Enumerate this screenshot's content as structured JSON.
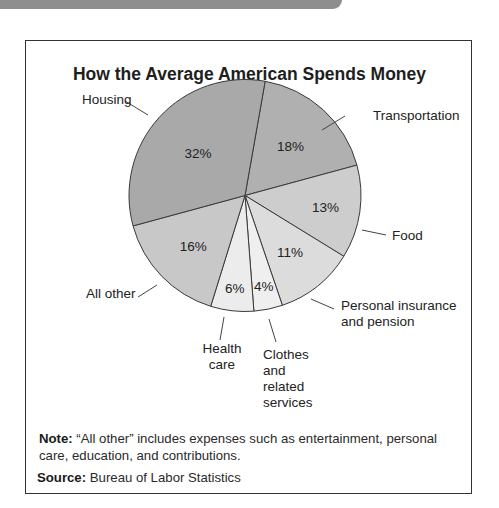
{
  "header_bar": {
    "color": "#8e8e8e"
  },
  "chart_data": {
    "type": "pie",
    "title": "How the Average American Spends Money",
    "unit": "%",
    "start_angle_deg_from_top": 10,
    "direction": "clockwise",
    "slices": [
      {
        "label": "Transportation",
        "value": 18,
        "display": "18%",
        "color": "#b0b0b0"
      },
      {
        "label": "Food",
        "value": 13,
        "display": "13%",
        "color": "#cdcdcd"
      },
      {
        "label": "Personal insurance and pension",
        "value": 11,
        "display": "11%",
        "color": "#dcdcdc"
      },
      {
        "label": "Clothes and related services",
        "value": 4,
        "display": "4%",
        "color": "#efefef"
      },
      {
        "label": "Health care",
        "value": 6,
        "display": "6%",
        "color": "#ececec"
      },
      {
        "label": "All other",
        "value": 16,
        "display": "16%",
        "color": "#c8c8c8"
      },
      {
        "label": "Housing",
        "value": 32,
        "display": "32%",
        "color": "#a9a9a9"
      }
    ]
  },
  "callouts": {
    "housing": "Housing",
    "transportation": "Transportation",
    "food": "Food",
    "personal_insurance_line1": "Personal insurance",
    "personal_insurance_line2": "and pension",
    "clothes_line1": "Clothes",
    "clothes_line2": "and",
    "clothes_line3": "related",
    "clothes_line4": "services",
    "health_line1": "Health",
    "health_line2": "care",
    "all_other": "All other"
  },
  "footer": {
    "note_label": "Note:",
    "note_text": " “All other” includes expenses such as entertainment, personal care, education, and contributions.",
    "source_label": "Source:",
    "source_text": " Bureau of Labor Statistics"
  }
}
